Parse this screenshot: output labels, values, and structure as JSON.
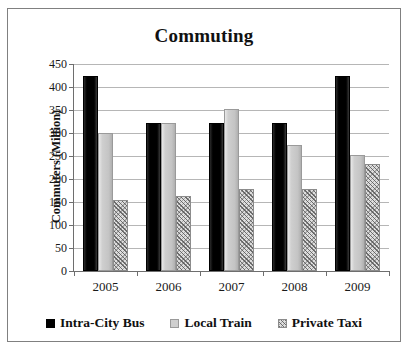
{
  "chart_data": {
    "type": "bar",
    "title": "Commuting",
    "xlabel": "",
    "ylabel": "Commuters (Million)",
    "categories": [
      "2005",
      "2006",
      "2007",
      "2008",
      "2009"
    ],
    "series": [
      {
        "name": "Intra-City Bus",
        "color": "#000000",
        "values": [
          425,
          322,
          322,
          322,
          425
        ]
      },
      {
        "name": "Local Train",
        "color": "#c4c4c4",
        "values": [
          300,
          322,
          352,
          275,
          252
        ]
      },
      {
        "name": "Private Taxi",
        "color": "#b5b5b5",
        "values": [
          155,
          163,
          178,
          178,
          232
        ]
      }
    ],
    "ylim": [
      0,
      450
    ],
    "ytick_step": 50,
    "ytick_labels": [
      "0",
      "50",
      "100",
      "150",
      "200",
      "250",
      "300",
      "350",
      "400",
      "450"
    ],
    "grid": true,
    "legend_position": "bottom"
  },
  "frame": {
    "border_color": "#808080"
  }
}
